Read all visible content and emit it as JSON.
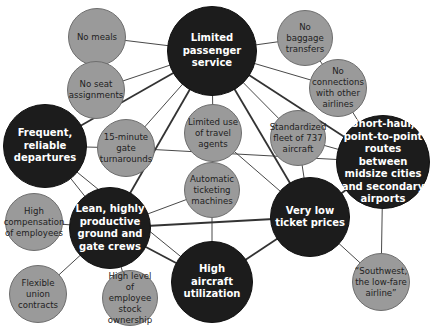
{
  "diagram": {
    "colors": {
      "primary_fill": "#1c1c1c",
      "secondary_fill": "#9a9a9a",
      "primary_text": "#ffffff",
      "secondary_text": "#222222",
      "edge": "#333333"
    },
    "nodes": [
      {
        "id": "limited_passenger_service",
        "type": "primary",
        "label": "Limited\npassenger\nservice",
        "cx": 212,
        "cy": 51,
        "r": 45
      },
      {
        "id": "frequent_reliable_departures",
        "type": "primary",
        "label": "Frequent,\nreliable\ndepartures",
        "cx": 45,
        "cy": 146,
        "r": 42
      },
      {
        "id": "short_haul_routes",
        "type": "primary",
        "label": "Short-haul,\npoint-to-point\nroutes between\nmidsize cities\nand secondary\nairports",
        "cx": 383,
        "cy": 162,
        "r": 47
      },
      {
        "id": "lean_crews",
        "type": "primary",
        "label": "Lean, highly\nproductive\nground and\ngate crews",
        "cx": 110,
        "cy": 228,
        "r": 41
      },
      {
        "id": "very_low_ticket_prices",
        "type": "primary",
        "label": "Very low\nticket prices",
        "cx": 310,
        "cy": 217,
        "r": 40
      },
      {
        "id": "high_aircraft_utilization",
        "type": "primary",
        "label": "High\naircraft\nutilization",
        "cx": 212,
        "cy": 282,
        "r": 41
      },
      {
        "id": "no_meals",
        "type": "secondary",
        "label": "No meals",
        "cx": 97,
        "cy": 37,
        "r": 29
      },
      {
        "id": "no_seat_assignments",
        "type": "secondary",
        "label": "No seat\nassignments",
        "cx": 96,
        "cy": 90,
        "r": 29
      },
      {
        "id": "gate_turnarounds",
        "type": "secondary",
        "label": "15-minute\ngate\nturnarounds",
        "cx": 126,
        "cy": 148,
        "r": 29
      },
      {
        "id": "limited_travel_agents",
        "type": "secondary",
        "label": "Limited use\nof travel\nagents",
        "cx": 213,
        "cy": 133,
        "r": 29
      },
      {
        "id": "automatic_ticketing",
        "type": "secondary",
        "label": "Automatic\nticketing\nmachines",
        "cx": 212,
        "cy": 190,
        "r": 28
      },
      {
        "id": "no_baggage_transfers",
        "type": "secondary",
        "label": "No baggage\ntransfers",
        "cx": 305,
        "cy": 38,
        "r": 28
      },
      {
        "id": "no_connections",
        "type": "secondary",
        "label": "No\nconnections\nwith other\nairlines",
        "cx": 338,
        "cy": 88,
        "r": 29
      },
      {
        "id": "standardized_fleet",
        "type": "secondary",
        "label": "Standardized\nfleet of 737\naircraft",
        "cx": 298,
        "cy": 138,
        "r": 28
      },
      {
        "id": "high_compensation",
        "type": "secondary",
        "label": "High\ncompensation\nof employees",
        "cx": 34,
        "cy": 222,
        "r": 29
      },
      {
        "id": "flexible_union_contracts",
        "type": "secondary",
        "label": "Flexible\nunion\ncontracts",
        "cx": 38,
        "cy": 294,
        "r": 29
      },
      {
        "id": "employee_stock_ownership",
        "type": "secondary",
        "label": "High level\nof employee\nstock\nownership",
        "cx": 130,
        "cy": 298,
        "r": 28
      },
      {
        "id": "southwest_low_fare",
        "type": "secondary",
        "label": "“Southwest,\nthe low-fare\nairline”",
        "cx": 381,
        "cy": 282,
        "r": 29
      }
    ],
    "edges": [
      {
        "from": "limited_passenger_service",
        "to": "no_meals",
        "w": 1
      },
      {
        "from": "limited_passenger_service",
        "to": "no_seat_assignments",
        "w": 1
      },
      {
        "from": "limited_passenger_service",
        "to": "gate_turnarounds",
        "w": 1
      },
      {
        "from": "limited_passenger_service",
        "to": "no_baggage_transfers",
        "w": 1
      },
      {
        "from": "limited_passenger_service",
        "to": "no_connections",
        "w": 1
      },
      {
        "from": "limited_passenger_service",
        "to": "limited_travel_agents",
        "w": 1
      },
      {
        "from": "limited_passenger_service",
        "to": "frequent_reliable_departures",
        "w": 2
      },
      {
        "from": "limited_passenger_service",
        "to": "lean_crews",
        "w": 2
      },
      {
        "from": "limited_passenger_service",
        "to": "very_low_ticket_prices",
        "w": 2
      },
      {
        "from": "limited_passenger_service",
        "to": "short_haul_routes",
        "w": 2
      },
      {
        "from": "no_baggage_transfers",
        "to": "no_connections",
        "w": 1
      },
      {
        "from": "no_connections",
        "to": "short_haul_routes",
        "w": 1
      },
      {
        "from": "frequent_reliable_departures",
        "to": "gate_turnarounds",
        "w": 1
      },
      {
        "from": "frequent_reliable_departures",
        "to": "lean_crews",
        "w": 1
      },
      {
        "from": "gate_turnarounds",
        "to": "short_haul_routes",
        "w": 1
      },
      {
        "from": "limited_travel_agents",
        "to": "automatic_ticketing",
        "w": 1
      },
      {
        "from": "limited_travel_agents",
        "to": "very_low_ticket_prices",
        "w": 1
      },
      {
        "from": "standardized_fleet",
        "to": "short_haul_routes",
        "w": 1
      },
      {
        "from": "standardized_fleet",
        "to": "very_low_ticket_prices",
        "w": 1
      },
      {
        "from": "standardized_fleet",
        "to": "limited_passenger_service",
        "w": 1
      },
      {
        "from": "short_haul_routes",
        "to": "very_low_ticket_prices",
        "w": 2
      },
      {
        "from": "short_haul_routes",
        "to": "southwest_low_fare",
        "w": 1
      },
      {
        "from": "lean_crews",
        "to": "automatic_ticketing",
        "w": 1
      },
      {
        "from": "lean_crews",
        "to": "very_low_ticket_prices",
        "w": 2
      },
      {
        "from": "lean_crews",
        "to": "high_aircraft_utilization",
        "w": 2
      },
      {
        "from": "lean_crews",
        "to": "high_compensation",
        "w": 1
      },
      {
        "from": "lean_crews",
        "to": "flexible_union_contracts",
        "w": 1
      },
      {
        "from": "lean_crews",
        "to": "employee_stock_ownership",
        "w": 1
      },
      {
        "from": "automatic_ticketing",
        "to": "high_aircraft_utilization",
        "w": 1
      },
      {
        "from": "very_low_ticket_prices",
        "to": "high_aircraft_utilization",
        "w": 2
      },
      {
        "from": "very_low_ticket_prices",
        "to": "southwest_low_fare",
        "w": 1
      },
      {
        "from": "frequent_reliable_departures",
        "to": "high_aircraft_utilization",
        "w": 1
      }
    ]
  }
}
